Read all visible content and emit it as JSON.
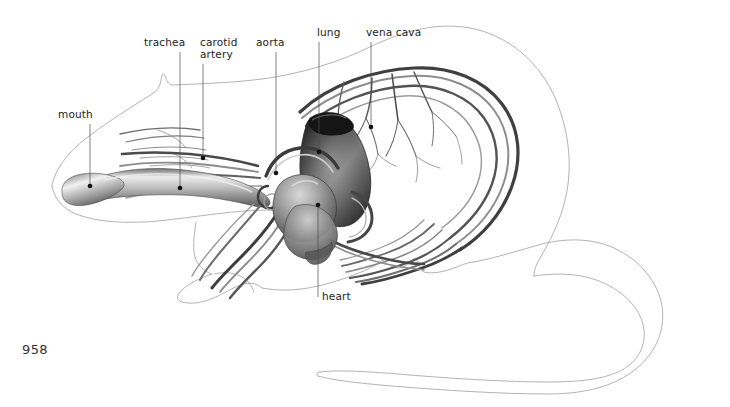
{
  "figure": {
    "kind": "anatomical-illustration",
    "background_color": "#ffffff",
    "ink_color": "#242424",
    "outline_color": "#9a9a9a",
    "leader_color": "#4a4a4a",
    "folio": "958",
    "labels": [
      {
        "id": "mouth",
        "text": "mouth",
        "text_x": 58,
        "text_y": 118,
        "anchor": "start",
        "leader": "M 90,124 L 90,185",
        "dot_x": 90,
        "dot_y": 186
      },
      {
        "id": "trachea",
        "text": "trachea",
        "text_x": 144,
        "text_y": 46,
        "anchor": "start",
        "leader": "M 180,52 L 180,187",
        "dot_x": 180,
        "dot_y": 188
      },
      {
        "id": "carotid-artery",
        "text": "carotid",
        "text_line_2": "artery",
        "text_x": 200,
        "text_y": 46,
        "text_y2": 58,
        "anchor": "start",
        "leader": "M 203,64 L 203,157",
        "dot_x": 203,
        "dot_y": 158
      },
      {
        "id": "aorta",
        "text": "aorta",
        "text_x": 256,
        "text_y": 46,
        "anchor": "start",
        "leader": "M 276,52 L 276,172",
        "dot_x": 276,
        "dot_y": 173
      },
      {
        "id": "lung",
        "text": "lung",
        "text_x": 317,
        "text_y": 36,
        "anchor": "start",
        "leader": "M 319,42 L 319,151",
        "dot_x": 319,
        "dot_y": 152
      },
      {
        "id": "vena-cava",
        "text": "vena cava",
        "text_x": 366,
        "text_y": 36,
        "anchor": "start",
        "leader": "M 371,42 L 371,126",
        "dot_x": 371,
        "dot_y": 127
      },
      {
        "id": "heart",
        "text": "heart",
        "text_x": 322,
        "text_y": 300,
        "anchor": "start",
        "leader": "M 318,206 L 318,297",
        "dot_x": 318,
        "dot_y": 205
      }
    ],
    "organs": [
      {
        "id": "lung",
        "name": "lung",
        "shading": "dark-gradient"
      },
      {
        "id": "heart",
        "name": "heart",
        "shading": "mid-gradient"
      },
      {
        "id": "trachea",
        "name": "trachea",
        "shading": "tube-gradient"
      }
    ]
  }
}
